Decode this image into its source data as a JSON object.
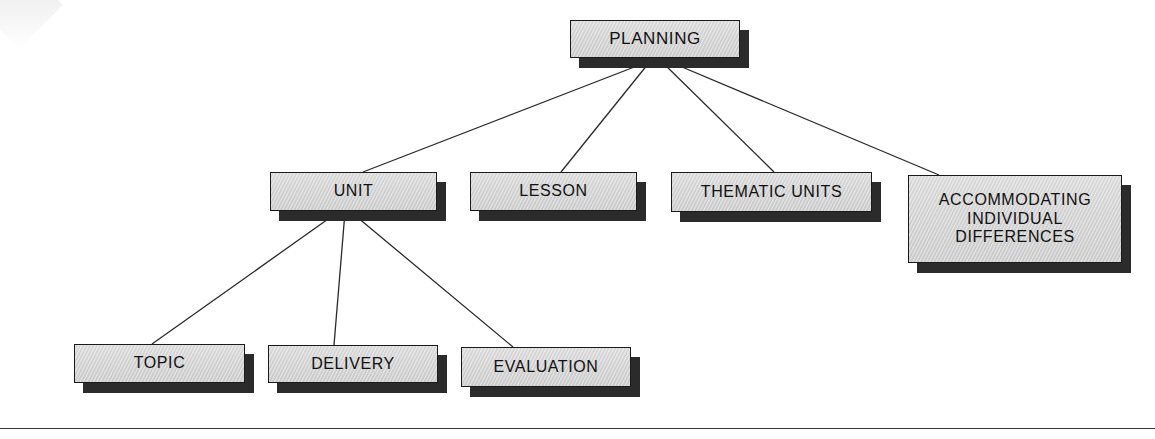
{
  "diagram": {
    "type": "hierarchy-tree",
    "title": "PLANNING",
    "background_color": "#ffffff",
    "node_fill_color": "#d6d6d6",
    "node_border_color": "#1a1a1a",
    "node_shadow_color": "#2b2b2b",
    "text_color": "#111111",
    "connector_color": "#2a2a2a",
    "levels": 3,
    "nodes": [
      {
        "id": "planning",
        "label": "PLANNING",
        "level": 0,
        "x": 570,
        "y": 20,
        "w": 170,
        "h": 38,
        "font_size": 17
      },
      {
        "id": "unit",
        "label": "UNIT",
        "level": 1,
        "x": 270,
        "y": 172,
        "w": 167,
        "h": 39,
        "font_size": 16
      },
      {
        "id": "lesson",
        "label": "LESSON",
        "level": 1,
        "x": 470,
        "y": 172,
        "w": 167,
        "h": 39,
        "font_size": 16
      },
      {
        "id": "thematic-units",
        "label": "THEMATIC UNITS",
        "level": 1,
        "x": 671,
        "y": 172,
        "w": 201,
        "h": 40,
        "font_size": 16
      },
      {
        "id": "accommodating-individual-differences",
        "label": "ACCOMMODATING\nINDIVIDUAL\nDIFFERENCES",
        "level": 1,
        "x": 908,
        "y": 175,
        "w": 214,
        "h": 88,
        "font_size": 16
      },
      {
        "id": "topic",
        "label": "TOPIC",
        "level": 2,
        "x": 74,
        "y": 344,
        "w": 171,
        "h": 39,
        "font_size": 16
      },
      {
        "id": "delivery",
        "label": "DELIVERY",
        "level": 2,
        "x": 268,
        "y": 345,
        "w": 170,
        "h": 38,
        "font_size": 16
      },
      {
        "id": "evaluation",
        "label": "EVALUATION",
        "level": 2,
        "x": 461,
        "y": 347,
        "w": 170,
        "h": 40,
        "font_size": 16
      }
    ],
    "edges": [
      {
        "from": "planning",
        "to": "unit",
        "x1": 655,
        "y1": 59,
        "x2": 363,
        "y2": 172
      },
      {
        "from": "planning",
        "to": "lesson",
        "x1": 652,
        "y1": 59,
        "x2": 561,
        "y2": 172
      },
      {
        "from": "planning",
        "to": "thematic-units",
        "x1": 659,
        "y1": 59,
        "x2": 774,
        "y2": 172
      },
      {
        "from": "planning",
        "to": "accommodating-individual-differences",
        "x1": 663,
        "y1": 59,
        "x2": 939,
        "y2": 175
      },
      {
        "from": "unit",
        "to": "topic",
        "x1": 338,
        "y1": 212,
        "x2": 152,
        "y2": 344
      },
      {
        "from": "unit",
        "to": "delivery",
        "x1": 345,
        "y1": 212,
        "x2": 334,
        "y2": 345
      },
      {
        "from": "unit",
        "to": "evaluation",
        "x1": 351,
        "y1": 212,
        "x2": 513,
        "y2": 347
      }
    ],
    "shadow_offset": {
      "x": 9,
      "y": 10
    },
    "bottom_rule": {
      "y": 428,
      "color": "#3a3a3a"
    }
  }
}
